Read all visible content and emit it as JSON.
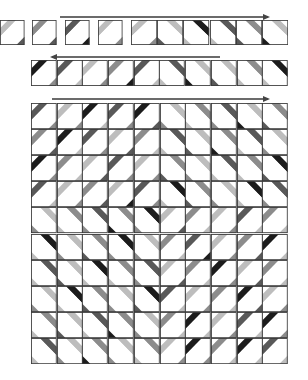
{
  "diagram": {
    "title": "",
    "colors": {
      "black": "#1c1c1c",
      "dark": "#595959",
      "mid": "#8c8c8c",
      "light": "#bdbdbd",
      "white": "#ffffff",
      "line": "#3a3a3a"
    },
    "row1": {
      "arrow_direction": "right",
      "loose_cells": [
        {
          "dir": "/",
          "band": "light",
          "corner": "dark"
        },
        {
          "dir": "/",
          "band": "mid",
          "corner": "dark"
        },
        {
          "dir": "/",
          "band": "dark",
          "corner": "black"
        },
        {
          "dir": "/",
          "band": "light",
          "corner": "mid"
        }
      ],
      "strip_cells": [
        {
          "dir": "/",
          "band": "light",
          "corner": "mid"
        },
        {
          "dir": "\\",
          "band": "light",
          "corner": "dark"
        },
        {
          "dir": "\\",
          "band": "black",
          "corner": "light"
        },
        {
          "dir": "\\",
          "band": "dark",
          "corner": "light"
        },
        {
          "dir": "\\",
          "band": "mid",
          "corner": "dark"
        },
        {
          "dir": "\\",
          "band": "light",
          "corner": "black"
        }
      ]
    },
    "row2": {
      "arrow_direction": "left",
      "cells": [
        {
          "dir": "/",
          "band": "black",
          "corner": "mid"
        },
        {
          "dir": "/",
          "band": "dark",
          "corner": "light"
        },
        {
          "dir": "/",
          "band": "light",
          "corner": "mid"
        },
        {
          "dir": "/",
          "band": "mid",
          "corner": "black"
        },
        {
          "dir": "/",
          "band": "dark",
          "corner": "light"
        },
        {
          "dir": "\\",
          "band": "dark",
          "corner": "light"
        },
        {
          "dir": "\\",
          "band": "light",
          "corner": "black"
        },
        {
          "dir": "\\",
          "band": "light",
          "corner": "dark"
        },
        {
          "dir": "\\",
          "band": "mid",
          "corner": "light"
        },
        {
          "dir": "\\",
          "band": "black",
          "corner": "light"
        }
      ]
    },
    "quilt": {
      "arrow_direction": "right",
      "rows": 10,
      "cols": 10,
      "cells": [
        [
          [
            "/",
            "dark",
            "mid"
          ],
          [
            "/",
            "light",
            "mid"
          ],
          [
            "/",
            "black",
            "light"
          ],
          [
            "/",
            "dark",
            "mid"
          ],
          [
            "/",
            "black",
            "dark"
          ],
          [
            "\\",
            "light",
            "mid"
          ],
          [
            "\\",
            "mid",
            "light"
          ],
          [
            "\\",
            "dark",
            "mid"
          ],
          [
            "\\",
            "light",
            "black"
          ],
          [
            "\\",
            "mid",
            "dark"
          ]
        ],
        [
          [
            "/",
            "mid",
            "dark"
          ],
          [
            "/",
            "black",
            "light"
          ],
          [
            "/",
            "dark",
            "mid"
          ],
          [
            "/",
            "light",
            "dark"
          ],
          [
            "/",
            "mid",
            "light"
          ],
          [
            "\\",
            "dark",
            "light"
          ],
          [
            "\\",
            "light",
            "dark"
          ],
          [
            "\\",
            "mid",
            "black"
          ],
          [
            "\\",
            "dark",
            "light"
          ],
          [
            "\\",
            "light",
            "mid"
          ]
        ],
        [
          [
            "/",
            "black",
            "mid"
          ],
          [
            "/",
            "mid",
            "light"
          ],
          [
            "/",
            "light",
            "dark"
          ],
          [
            "/",
            "dark",
            "mid"
          ],
          [
            "/",
            "light",
            "mid"
          ],
          [
            "\\",
            "mid",
            "dark"
          ],
          [
            "\\",
            "light",
            "mid"
          ],
          [
            "\\",
            "dark",
            "light"
          ],
          [
            "\\",
            "mid",
            "light"
          ],
          [
            "\\",
            "black",
            "dark"
          ]
        ],
        [
          [
            "/",
            "dark",
            "light"
          ],
          [
            "/",
            "light",
            "mid"
          ],
          [
            "/",
            "mid",
            "dark"
          ],
          [
            "/",
            "light",
            "black"
          ],
          [
            "/",
            "dark",
            "mid"
          ],
          [
            "\\",
            "black",
            "light"
          ],
          [
            "\\",
            "mid",
            "dark"
          ],
          [
            "\\",
            "light",
            "mid"
          ],
          [
            "\\",
            "black",
            "light"
          ],
          [
            "\\",
            "dark",
            "mid"
          ]
        ],
        [
          [
            "\\",
            "light",
            "mid"
          ],
          [
            "\\",
            "mid",
            "light"
          ],
          [
            "\\",
            "dark",
            "mid"
          ],
          [
            "\\",
            "mid",
            "black"
          ],
          [
            "\\",
            "black",
            "mid"
          ],
          [
            "/",
            "light",
            "dark"
          ],
          [
            "/",
            "mid",
            "light"
          ],
          [
            "/",
            "light",
            "mid"
          ],
          [
            "/",
            "dark",
            "light"
          ],
          [
            "/",
            "mid",
            "light"
          ]
        ],
        [
          [
            "\\",
            "black",
            "light"
          ],
          [
            "\\",
            "light",
            "mid"
          ],
          [
            "\\",
            "mid",
            "dark"
          ],
          [
            "\\",
            "black",
            "mid"
          ],
          [
            "\\",
            "light",
            "mid"
          ],
          [
            "/",
            "mid",
            "light"
          ],
          [
            "/",
            "dark",
            "black"
          ],
          [
            "/",
            "light",
            "mid"
          ],
          [
            "/",
            "mid",
            "dark"
          ],
          [
            "/",
            "black",
            "light"
          ]
        ],
        [
          [
            "\\",
            "dark",
            "light"
          ],
          [
            "\\",
            "light",
            "dark"
          ],
          [
            "\\",
            "black",
            "light"
          ],
          [
            "\\",
            "mid",
            "light"
          ],
          [
            "\\",
            "dark",
            "mid"
          ],
          [
            "/",
            "light",
            "dark"
          ],
          [
            "/",
            "mid",
            "light"
          ],
          [
            "/",
            "black",
            "mid"
          ],
          [
            "/",
            "light",
            "dark"
          ],
          [
            "/",
            "mid",
            "light"
          ]
        ],
        [
          [
            "\\",
            "light",
            "mid"
          ],
          [
            "\\",
            "black",
            "light"
          ],
          [
            "\\",
            "mid",
            "dark"
          ],
          [
            "\\",
            "light",
            "mid"
          ],
          [
            "\\",
            "black",
            "dark"
          ],
          [
            "/",
            "dark",
            "light"
          ],
          [
            "/",
            "light",
            "mid"
          ],
          [
            "/",
            "mid",
            "light"
          ],
          [
            "/",
            "black",
            "dark"
          ],
          [
            "/",
            "light",
            "mid"
          ]
        ],
        [
          [
            "\\",
            "mid",
            "light"
          ],
          [
            "\\",
            "light",
            "dark"
          ],
          [
            "\\",
            "dark",
            "light"
          ],
          [
            "\\",
            "mid",
            "black"
          ],
          [
            "\\",
            "light",
            "mid"
          ],
          [
            "/",
            "mid",
            "light"
          ],
          [
            "/",
            "black",
            "light"
          ],
          [
            "/",
            "light",
            "mid"
          ],
          [
            "/",
            "dark",
            "light"
          ],
          [
            "/",
            "black",
            "mid"
          ]
        ],
        [
          [
            "\\",
            "dark",
            "light"
          ],
          [
            "\\",
            "light",
            "mid"
          ],
          [
            "\\",
            "mid",
            "black"
          ],
          [
            "\\",
            "light",
            "mid"
          ],
          [
            "\\",
            "mid",
            "light"
          ],
          [
            "/",
            "light",
            "mid"
          ],
          [
            "/",
            "black",
            "mid"
          ],
          [
            "/",
            "mid",
            "light"
          ],
          [
            "/",
            "black",
            "light"
          ],
          [
            "/",
            "dark",
            "light"
          ]
        ]
      ]
    }
  }
}
